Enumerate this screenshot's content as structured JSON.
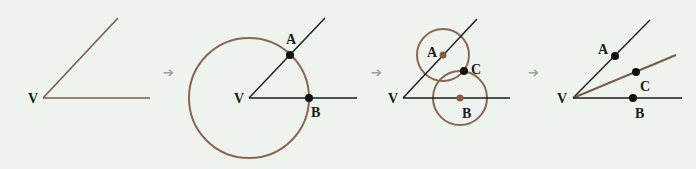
{
  "colors": {
    "background": "#eef3ee",
    "line_dark": "#1a1a1a",
    "line_brown": "#7b5a4c",
    "circle_brown": "#8a6552",
    "point_brown": "#8a5a3c",
    "point_black": "#111111",
    "arrow": "#9aa39a"
  },
  "steps": [
    {
      "name": "step-1-angle",
      "labels": {
        "V": "V"
      },
      "vertex": [
        43,
        98
      ],
      "rays": [
        {
          "to": [
            118,
            18
          ],
          "color": "line_brown"
        },
        {
          "to": [
            150,
            98
          ],
          "color": "line_brown"
        }
      ]
    },
    {
      "name": "step-2-arc-from-vertex",
      "labels": {
        "V": "V",
        "A": "A",
        "B": "B"
      },
      "vertex": [
        249,
        98
      ],
      "rays": [
        {
          "to": [
            325,
            18
          ],
          "color": "line_dark"
        },
        {
          "to": [
            357,
            98
          ],
          "color": "line_dark"
        }
      ],
      "circles": [
        {
          "center": [
            249,
            98
          ],
          "r": 60
        }
      ],
      "points": {
        "A": [
          290,
          55
        ],
        "B": [
          309,
          98
        ]
      }
    },
    {
      "name": "step-3-arcs-from-A-and-B",
      "labels": {
        "V": "V",
        "A": "A",
        "B": "B",
        "C": "C"
      },
      "vertex": [
        403,
        98
      ],
      "rays": [
        {
          "to": [
            477,
            19
          ],
          "color": "line_dark"
        },
        {
          "to": [
            510,
            98
          ],
          "color": "line_dark"
        }
      ],
      "circles": [
        {
          "center": [
            443,
            55
          ],
          "r": 27
        },
        {
          "center": [
            460,
            98
          ],
          "r": 27
        }
      ],
      "points": {
        "A": [
          443,
          55
        ],
        "B": [
          460,
          98
        ],
        "C": [
          464,
          71
        ]
      }
    },
    {
      "name": "step-4-bisector",
      "labels": {
        "V": "V",
        "A": "A",
        "B": "B",
        "C": "C"
      },
      "vertex": [
        573,
        98
      ],
      "rays": [
        {
          "to": [
            650,
            20
          ],
          "color": "line_dark"
        },
        {
          "to": [
            676,
            55
          ],
          "color": "line_brown"
        },
        {
          "to": [
            682,
            98
          ],
          "color": "line_dark"
        }
      ],
      "points": {
        "A": [
          615,
          56
        ],
        "C": [
          636,
          72
        ],
        "B": [
          633,
          98
        ]
      }
    }
  ],
  "arrows": [
    {
      "name": "arrow-1",
      "at": [
        170,
        72
      ],
      "glyph": "➔"
    },
    {
      "name": "arrow-2",
      "at": [
        377,
        72
      ],
      "glyph": "➔"
    },
    {
      "name": "arrow-3",
      "at": [
        535,
        72
      ],
      "glyph": "➔"
    }
  ]
}
